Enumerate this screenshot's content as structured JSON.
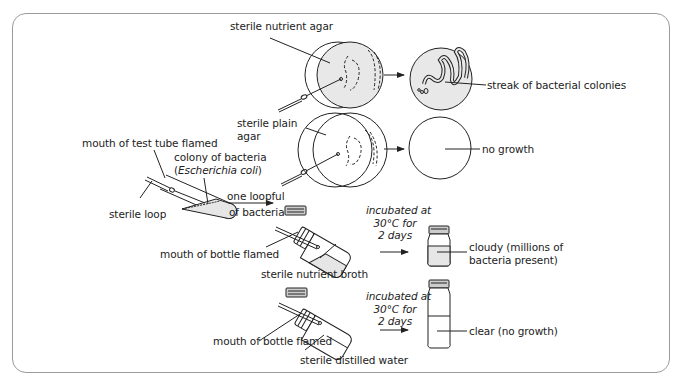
{
  "figure": {
    "labels": {
      "sterile_nutrient_agar": "sterile nutrient agar",
      "streak_colonies": "streak of bacterial colonies",
      "sterile_plain_agar_1": "sterile plain",
      "sterile_plain_agar_2": "agar",
      "no_growth": "no growth",
      "mouth_test_tube": "mouth of test tube flamed",
      "colony_1": "colony of bacteria",
      "colony_2_open": "(",
      "colony_2_species": "Escherichia coli",
      "colony_2_close": ")",
      "sterile_loop": "sterile loop",
      "one_loopful_1": "one loopful",
      "one_loopful_2": "of bacteria",
      "mouth_bottle_1": "mouth of bottle flamed",
      "nutrient_broth": "sterile nutrient broth",
      "incubated_1a": "incubated at",
      "incubated_1b": "30°C for",
      "incubated_1c": "2 days",
      "cloudy_1": "cloudy (millions of",
      "cloudy_2": "bacteria present)",
      "mouth_bottle_2": "mouth of bottle flamed",
      "distilled_water": "sterile distilled water",
      "incubated_2a": "incubated at",
      "incubated_2b": "30°C for",
      "incubated_2c": "2 days",
      "clear": "clear (no growth)"
    },
    "colors": {
      "frame_border": "#9a9a9a",
      "line": "#222222",
      "shade": "#e6e6e6"
    }
  }
}
